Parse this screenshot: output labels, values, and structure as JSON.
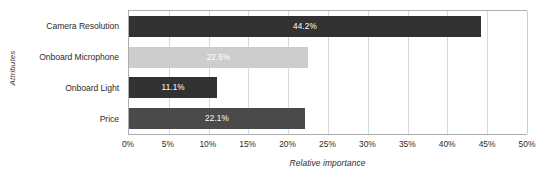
{
  "chart_data": {
    "type": "bar",
    "orientation": "horizontal",
    "title": "",
    "xlabel": "Relative importance",
    "ylabel": "Attributes",
    "categories": [
      "Camera Resolution",
      "Onboard Microphone",
      "Onboard Light",
      "Price"
    ],
    "values": [
      44.2,
      22.5,
      11.1,
      22.1
    ],
    "value_labels": [
      "44.2%",
      "22.5%",
      "11.1%",
      "22.1%"
    ],
    "bar_colors": [
      "#323232",
      "#cdcdcd",
      "#323232",
      "#4a4a4a"
    ],
    "xlim": [
      0,
      50
    ],
    "xtick_values": [
      0,
      5,
      10,
      15,
      20,
      25,
      30,
      35,
      40,
      45,
      50
    ],
    "xtick_labels": [
      "0%",
      "5%",
      "10%",
      "15%",
      "20%",
      "25%",
      "30%",
      "35%",
      "40%",
      "45%",
      "50%"
    ],
    "grid": true,
    "grid_axis": "x",
    "legend": false,
    "legend_position": "none",
    "axis_color": "#adadad",
    "gridline_color": "#d9d9d9",
    "value_label_color": "#ffffff"
  }
}
